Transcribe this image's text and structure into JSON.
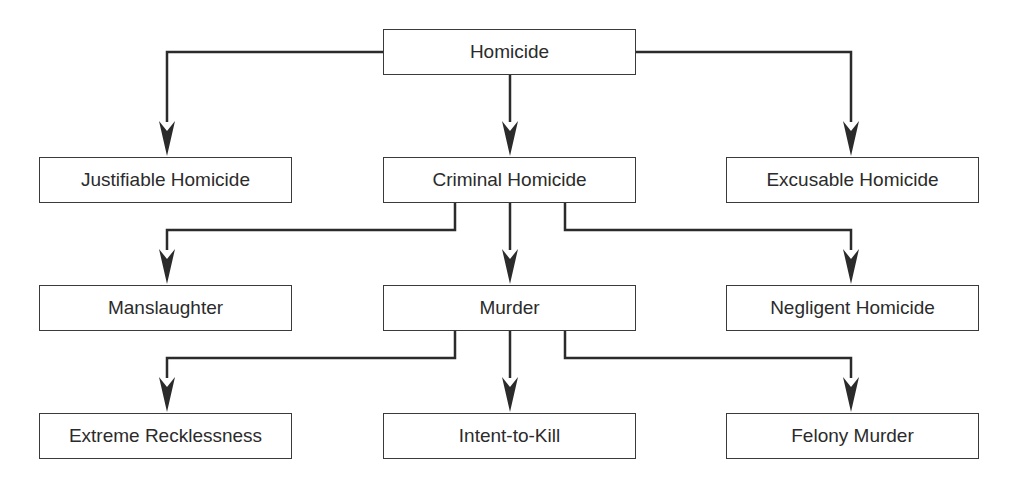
{
  "colors": {
    "line": "#2b2b2b",
    "border": "#3a3a3a",
    "text": "#2b2b2b",
    "background": "#ffffff"
  },
  "nodes": {
    "homicide": {
      "label": "Homicide",
      "x": 383,
      "y": 29
    },
    "justifiable": {
      "label": "Justifiable Homicide",
      "x": 39,
      "y": 157
    },
    "criminal": {
      "label": "Criminal Homicide",
      "x": 383,
      "y": 157
    },
    "excusable": {
      "label": "Excusable Homicide",
      "x": 726,
      "y": 157
    },
    "manslaughter": {
      "label": "Manslaughter",
      "x": 39,
      "y": 285
    },
    "murder": {
      "label": "Murder",
      "x": 383,
      "y": 285
    },
    "negligent": {
      "label": "Negligent Homicide",
      "x": 726,
      "y": 285
    },
    "extreme": {
      "label": "Extreme Recklessness",
      "x": 39,
      "y": 413
    },
    "intent": {
      "label": "Intent-to-Kill",
      "x": 383,
      "y": 413
    },
    "felony": {
      "label": "Felony Murder",
      "x": 726,
      "y": 413
    }
  },
  "edges": [
    {
      "from": "Homicide",
      "to": "Justifiable Homicide"
    },
    {
      "from": "Homicide",
      "to": "Criminal Homicide"
    },
    {
      "from": "Homicide",
      "to": "Excusable Homicide"
    },
    {
      "from": "Criminal Homicide",
      "to": "Manslaughter"
    },
    {
      "from": "Criminal Homicide",
      "to": "Murder"
    },
    {
      "from": "Criminal Homicide",
      "to": "Negligent Homicide"
    },
    {
      "from": "Murder",
      "to": "Extreme Recklessness"
    },
    {
      "from": "Murder",
      "to": "Intent-to-Kill"
    },
    {
      "from": "Murder",
      "to": "Felony Murder"
    }
  ]
}
